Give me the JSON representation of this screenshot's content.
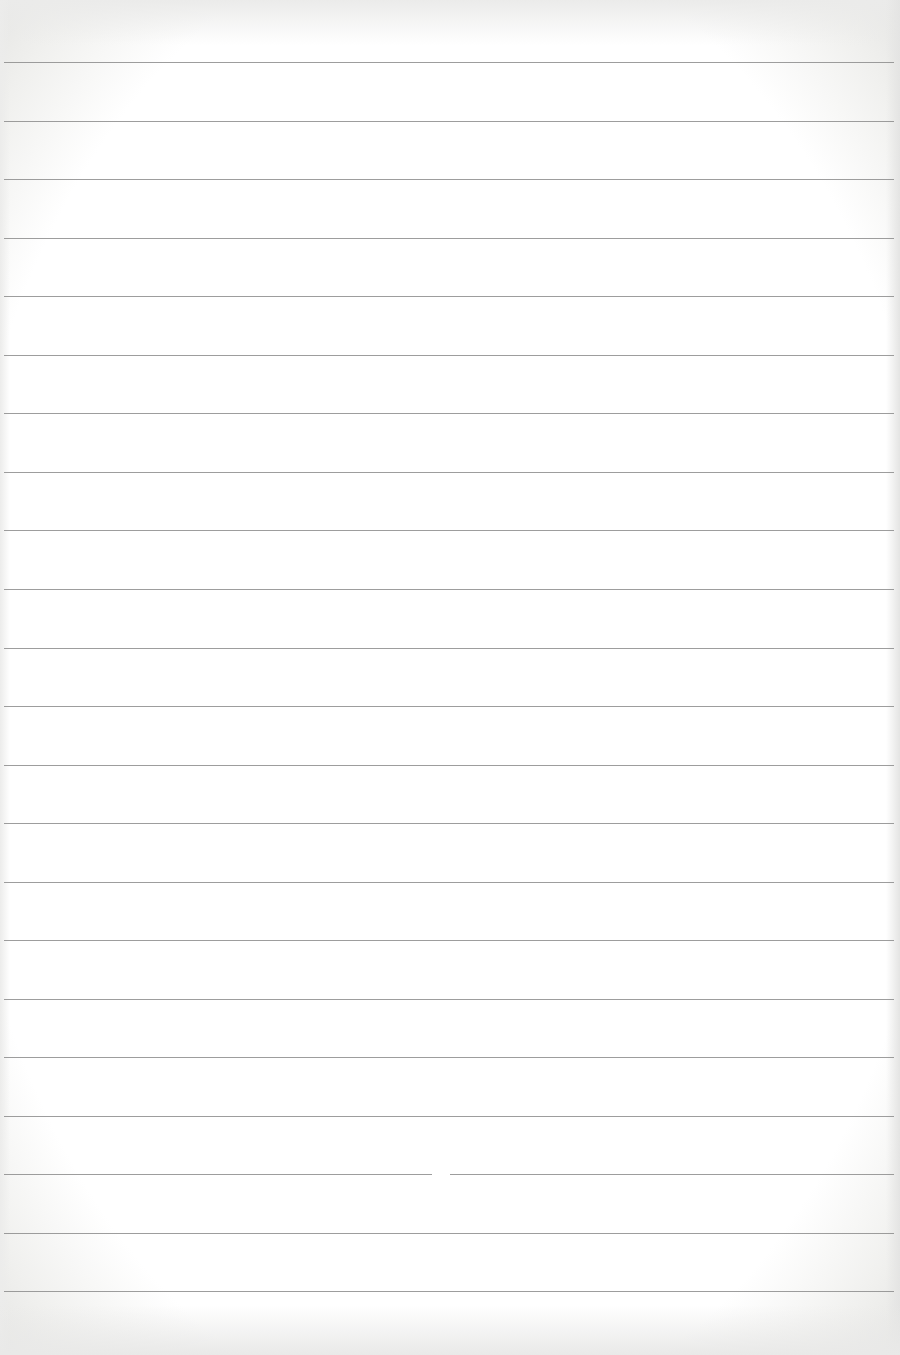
{
  "page": {
    "type": "lined-paper",
    "background_color": "#ffffff",
    "rule_color": "#8c8c8c",
    "rule_count": 22,
    "first_rule_y": 62,
    "rule_spacing": 58.6,
    "rules": [
      62,
      121,
      179,
      238,
      296,
      355,
      413,
      472,
      530,
      589,
      648,
      706,
      765,
      823,
      882,
      940,
      999,
      1057,
      1116,
      1174,
      1233,
      1291
    ],
    "gaps": [
      {
        "rule_index": 19,
        "x": 432,
        "width": 18
      }
    ]
  }
}
